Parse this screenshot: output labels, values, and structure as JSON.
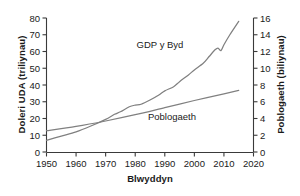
{
  "chart_data": {
    "type": "line",
    "title": "",
    "xlabel": "Blwyddyn",
    "ylabel_left": "Doleri UDA (triliynau)",
    "ylabel_right": "Poblogaeth (biliynau)",
    "grid": false,
    "legend_position": "inline-annotations",
    "xlim": [
      1950,
      2020
    ],
    "ylim_left": [
      0,
      80
    ],
    "ylim_right": [
      0,
      16
    ],
    "x_ticks": [
      1950,
      1960,
      1970,
      1980,
      1990,
      2000,
      2010,
      2020
    ],
    "y_ticks_left": [
      0,
      10,
      20,
      30,
      40,
      50,
      60,
      70,
      80
    ],
    "y_ticks_right": [
      0,
      2,
      4,
      6,
      8,
      10,
      12,
      14,
      16
    ],
    "line_color": "#808080",
    "axis_color": "#3a3a3a",
    "text_color": "#1a1a1a",
    "series": [
      {
        "name": "GDP y Byd",
        "axis": "left",
        "units": "triliynau o ddoleri UDA",
        "x": [
          1950,
          1955,
          1960,
          1965,
          1970,
          1973,
          1975,
          1978,
          1980,
          1982,
          1985,
          1988,
          1990,
          1993,
          1995,
          1998,
          2000,
          2003,
          2005,
          2007,
          2008,
          2009,
          2010,
          2012,
          2015
        ],
        "values": [
          7,
          9.5,
          12,
          15.5,
          19.5,
          22.5,
          24,
          27,
          28,
          28.5,
          31,
          34,
          36.5,
          39,
          42,
          46,
          49,
          53,
          57,
          61,
          62,
          60.5,
          64,
          70,
          78
        ]
      },
      {
        "name": "Poblogaeth",
        "axis": "right",
        "units": "biliynau",
        "x": [
          1950,
          1960,
          1970,
          1980,
          1990,
          2000,
          2010,
          2015
        ],
        "values": [
          2.55,
          3.05,
          3.7,
          4.45,
          5.3,
          6.15,
          6.95,
          7.35
        ]
      }
    ],
    "annotations": [
      {
        "name": "GDP y Byd",
        "label": "GDP y Byd",
        "x_px": 160,
        "y_px": 45
      },
      {
        "name": "Poblogaeth",
        "label": "Poblogaeth",
        "x_px": 172,
        "y_px": 117
      }
    ]
  }
}
